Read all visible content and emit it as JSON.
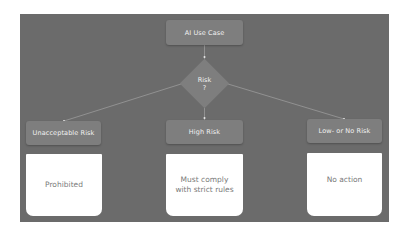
{
  "diagram": {
    "root": {
      "label": "AI Use Case"
    },
    "decision": {
      "line1": "Risk",
      "line2": "?"
    },
    "branches": [
      {
        "label": "Unacceptable Risk",
        "outcome_line1": "Prohibited",
        "outcome_line2": ""
      },
      {
        "label": "High Risk",
        "outcome_line1": "Must comply",
        "outcome_line2": "with strict rules"
      },
      {
        "label": "Low- or No Risk",
        "outcome_line1": "No action",
        "outcome_line2": ""
      }
    ],
    "colors": {
      "panel": "#6b6b6b",
      "node": "#7e7e7e",
      "node_text": "#f2f2f2",
      "outcome_bg": "#ffffff",
      "outcome_text": "#7a7a7a",
      "edge": "#9a9a9a"
    }
  }
}
